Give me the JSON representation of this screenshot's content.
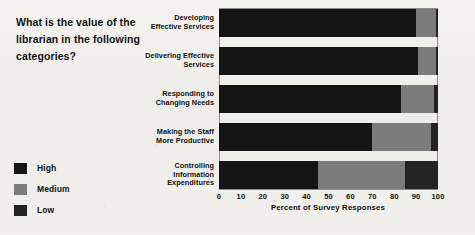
{
  "question": {
    "lines": [
      "What is the value of the",
      "librarian in the following",
      "categories?"
    ]
  },
  "legend": {
    "position": "bottom-left",
    "items": [
      {
        "label": "High",
        "color": "#141414"
      },
      {
        "label": "Medium",
        "color": "#7c7c7c"
      },
      {
        "label": "Low",
        "color": "#232323"
      }
    ]
  },
  "axis": {
    "title": "Percent of Survey Responses",
    "ticks": [
      "0",
      "10",
      "20",
      "30",
      "40",
      "50",
      "60",
      "70",
      "80",
      "90",
      "100"
    ]
  },
  "chart_data": {
    "type": "bar",
    "orientation": "horizontal",
    "stacked": true,
    "title": "",
    "subtitle": "",
    "xlabel": "Percent of Survey Responses",
    "ylabel": "",
    "xlim": [
      0,
      100
    ],
    "xticks": [
      0,
      10,
      20,
      30,
      40,
      50,
      60,
      70,
      80,
      90,
      100
    ],
    "grid": false,
    "legend_position": "bottom-left",
    "categories": [
      "Developing Effective Services",
      "Delivering Effective Services",
      "Responding to Changing Needs",
      "Making the Staff More Productive",
      "Controlling Information Expenditures"
    ],
    "category_label_lines": [
      [
        "Developing",
        "Effective Services"
      ],
      [
        "Delivering Effective",
        "Services"
      ],
      [
        "Responding to",
        "Changing Needs"
      ],
      [
        "Making the Staff",
        "More Productive"
      ],
      [
        "Controlling",
        "Information",
        "Expenditures"
      ]
    ],
    "series": [
      {
        "name": "High",
        "color": "#141414",
        "values": [
          90,
          91,
          83,
          70,
          45
        ]
      },
      {
        "name": "Medium",
        "color": "#7c7c7c",
        "values": [
          9,
          8,
          15,
          27,
          40
        ]
      },
      {
        "name": "Low",
        "color": "#232323",
        "values": [
          1,
          1,
          2,
          3,
          15
        ]
      }
    ]
  },
  "layout": {
    "plot_left_px": 219,
    "plot_width_px": 219,
    "bar_tops_px": [
      9,
      47,
      85,
      123,
      161
    ],
    "bar_height_px": 28
  }
}
